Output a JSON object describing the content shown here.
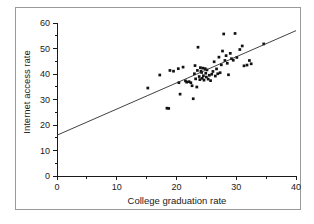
{
  "chart_data": {
    "type": "scatter",
    "title": "",
    "xlabel": "College graduation rate",
    "ylabel": "Internet access rate",
    "xlim": [
      0,
      40
    ],
    "ylim": [
      0,
      60
    ],
    "xticks": [
      0,
      10,
      20,
      30,
      40
    ],
    "yticks": [
      0,
      10,
      20,
      30,
      40,
      50,
      60
    ],
    "xtick_labels": [
      "0",
      "10",
      "20",
      "30",
      "40"
    ],
    "ytick_labels": [
      "0",
      "10",
      "20",
      "30",
      "40",
      "50",
      "60"
    ],
    "minor_tick_step_x": 5,
    "minor_tick_step_y": 5,
    "grid": false,
    "legend": null,
    "marker": "filled-square",
    "marker_color": "#111111",
    "trendline": {
      "type": "linear-fit",
      "color": "#2b2b2b",
      "x_start": 0,
      "y_start": 16.0,
      "x_end": 40,
      "y_end": 57.0,
      "slope": 1.025,
      "intercept": 16.0
    },
    "points": [
      [
        15.2,
        34.5
      ],
      [
        17.2,
        39.6
      ],
      [
        18.4,
        26.6
      ],
      [
        18.7,
        26.5
      ],
      [
        18.9,
        41.4
      ],
      [
        19.5,
        41.1
      ],
      [
        20.3,
        42.1
      ],
      [
        20.4,
        36.6
      ],
      [
        20.6,
        32.1
      ],
      [
        21.1,
        42.7
      ],
      [
        21.5,
        37.3
      ],
      [
        21.7,
        36.8
      ],
      [
        22.1,
        37.0
      ],
      [
        22.4,
        36.6
      ],
      [
        22.6,
        35.4
      ],
      [
        22.8,
        30.3
      ],
      [
        23.0,
        40.1
      ],
      [
        23.1,
        43.3
      ],
      [
        23.2,
        38.1
      ],
      [
        23.4,
        34.9
      ],
      [
        23.5,
        41.4
      ],
      [
        23.6,
        50.5
      ],
      [
        23.8,
        39.0
      ],
      [
        23.9,
        37.8
      ],
      [
        24.0,
        42.5
      ],
      [
        24.1,
        41.1
      ],
      [
        24.2,
        40.6
      ],
      [
        24.3,
        38.3
      ],
      [
        24.4,
        42.3
      ],
      [
        24.5,
        39.3
      ],
      [
        24.6,
        37.6
      ],
      [
        24.8,
        42.1
      ],
      [
        24.9,
        40.3
      ],
      [
        25.0,
        38.8
      ],
      [
        25.1,
        41.6
      ],
      [
        25.3,
        38.0
      ],
      [
        25.5,
        39.5
      ],
      [
        25.7,
        37.4
      ],
      [
        25.9,
        39.9
      ],
      [
        26.1,
        41.0
      ],
      [
        26.3,
        44.8
      ],
      [
        26.5,
        39.2
      ],
      [
        26.7,
        42.0
      ],
      [
        26.9,
        40.1
      ],
      [
        27.1,
        46.6
      ],
      [
        27.3,
        40.5
      ],
      [
        27.5,
        43.6
      ],
      [
        27.7,
        49.0
      ],
      [
        27.9,
        55.7
      ],
      [
        28.1,
        45.3
      ],
      [
        28.3,
        47.2
      ],
      [
        28.5,
        44.2
      ],
      [
        28.7,
        39.7
      ],
      [
        29.0,
        48.1
      ],
      [
        29.2,
        46.0
      ],
      [
        29.5,
        45.4
      ],
      [
        29.8,
        55.9
      ],
      [
        30.1,
        46.5
      ],
      [
        30.6,
        49.6
      ],
      [
        31.0,
        51.0
      ],
      [
        31.3,
        43.2
      ],
      [
        31.8,
        43.5
      ],
      [
        32.2,
        45.3
      ],
      [
        32.5,
        44.0
      ],
      [
        34.6,
        51.8
      ]
    ]
  }
}
